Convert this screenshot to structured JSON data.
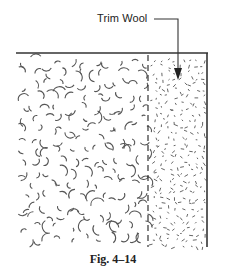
{
  "figure": {
    "label": "Trim Wool",
    "caption": "Fig. 4–14",
    "line_color": "#333333",
    "texture_color": "#555555",
    "regions": [
      {
        "name": "insulation",
        "texture": "curls"
      },
      {
        "name": "trim-wool",
        "texture": "dashes"
      }
    ]
  }
}
